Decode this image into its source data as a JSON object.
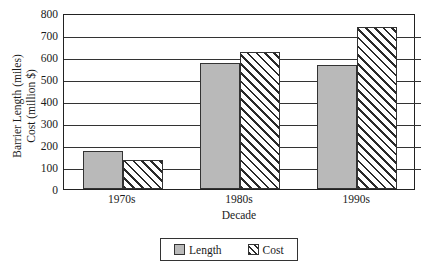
{
  "chart_data": {
    "type": "bar",
    "title": "",
    "xlabel": "Decade",
    "ylabel_lines": [
      "Barrier Length (miles)",
      "Cost (million $)"
    ],
    "categories": [
      "1970s",
      "1980s",
      "1990s"
    ],
    "series": [
      {
        "name": "Length",
        "values": [
          175,
          575,
          565
        ],
        "fill": "solid-gray",
        "color": "#b9b9b9"
      },
      {
        "name": "Cost",
        "values": [
          130,
          625,
          735
        ],
        "fill": "diagonal-hatch",
        "color": "#ffffff"
      }
    ],
    "ylim": [
      0,
      800
    ],
    "yticks": [
      0,
      100,
      200,
      300,
      400,
      500,
      600,
      700,
      800
    ],
    "ytick_labels": [
      "0",
      "100",
      "200",
      "300",
      "400",
      "500",
      "600",
      "700",
      "800"
    ],
    "grid": true,
    "grid_axis": "y",
    "legend_position": "bottom-center",
    "legend_entries": [
      "Length",
      "Cost"
    ],
    "frame": true
  },
  "axes": {
    "y_title_line1": "Barrier Length (miles)",
    "y_title_line2": "Cost (million $)",
    "x_title": "Decade"
  },
  "legend": {
    "items": [
      {
        "label": "Length"
      },
      {
        "label": "Cost"
      }
    ]
  }
}
